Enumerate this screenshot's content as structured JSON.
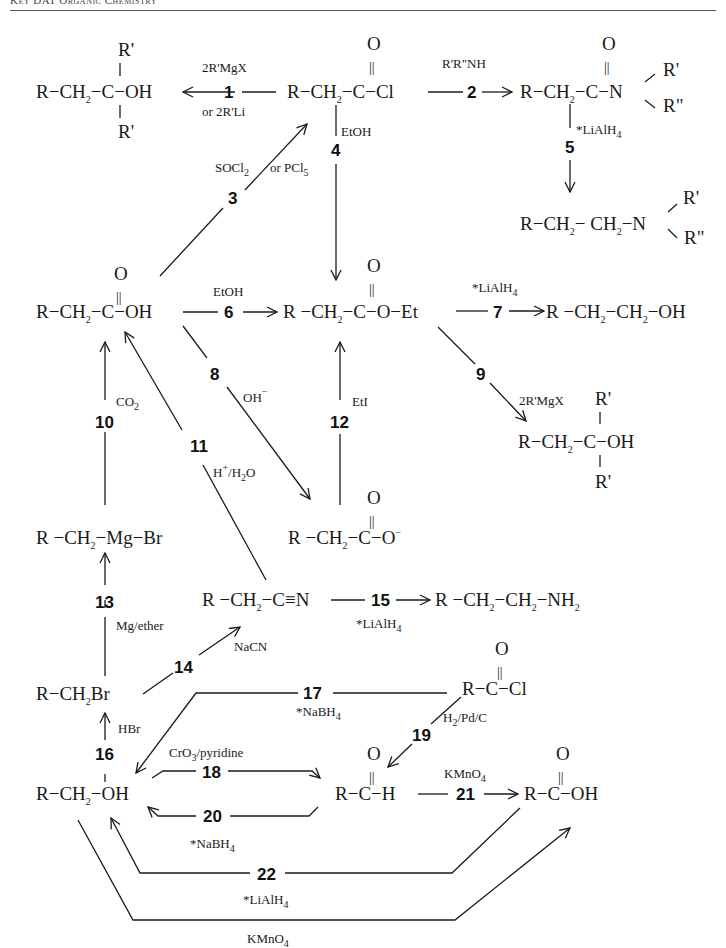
{
  "header": {
    "title": "Key DAT Organic Chemistry"
  },
  "diagram": {
    "compounds": {
      "tert_alcohol_top": {
        "main": "R−CH",
        "sub": "2",
        "rest": "−C−OH",
        "r_top": "R'",
        "r_bottom": "R'"
      },
      "acid_chloride": {
        "o": "O",
        "main": "R−CH",
        "sub": "2",
        "rest": "−C−Cl"
      },
      "amide": {
        "o": "O",
        "main": "R−CH",
        "sub": "2",
        "rest": "−C−N",
        "r1": "R'",
        "r2": "R\""
      },
      "amine_tertiary": {
        "main": "R−CH",
        "sub1": "2",
        "mid": "− CH",
        "sub2": "2",
        "rest": "−N",
        "r1": "R'",
        "r2": "R\""
      },
      "carboxylic_acid": {
        "o": "O",
        "main": "R−CH",
        "sub": "2",
        "rest": "−C−OH"
      },
      "ester": {
        "o": "O",
        "main": "R −CH",
        "sub": "2",
        "rest": "−C−O−Et"
      },
      "primary_alcohol_right": {
        "main": "R −CH",
        "sub1": "2",
        "mid": "−CH",
        "sub2": "2",
        "rest": "−OH"
      },
      "tert_alcohol_right": {
        "main": "R−CH",
        "sub": "2",
        "rest": "−C−OH",
        "r_top": "R'",
        "r_bottom": "R'"
      },
      "grignard": {
        "main": "R −CH",
        "sub": "2",
        "rest": "−Mg−Br"
      },
      "carboxylate": {
        "o": "O",
        "main": "R −CH",
        "sub": "2",
        "rest": "−C−O",
        "charge": "−"
      },
      "nitrile": {
        "main": "R −CH",
        "sub": "2",
        "rest": "−C≡N"
      },
      "primary_amine": {
        "main": "R −CH",
        "sub1": "2",
        "mid": "−CH",
        "sub2": "2",
        "rest": "−NH",
        "sub3": "2"
      },
      "alkyl_bromide": {
        "main": "R−CH",
        "sub": "2",
        "rest": "Br"
      },
      "acyl_chloride_simple": {
        "o": "O",
        "main": "R−C−Cl"
      },
      "primary_alcohol": {
        "main": "R−CH",
        "sub": "2",
        "rest": "−OH"
      },
      "aldehyde": {
        "o": "O",
        "main": "R−C−H"
      },
      "acid_simple": {
        "o": "O",
        "main": "R−C−OH"
      }
    },
    "reactions": [
      {
        "num": "1",
        "reagent": "2R'MgX",
        "reagent2": "or 2R'Li"
      },
      {
        "num": "2",
        "reagent": "R'R\"NH"
      },
      {
        "num": "3",
        "reagent": "SOCl",
        "reagent_sub": "2",
        "reagent2": "or PCl",
        "reagent2_sub": "5"
      },
      {
        "num": "4",
        "reagent": "EtOH"
      },
      {
        "num": "5",
        "reagent": "*LiAlH",
        "reagent_sub": "4"
      },
      {
        "num": "6",
        "reagent": "EtOH"
      },
      {
        "num": "7",
        "reagent": "*LiAlH",
        "reagent_sub": "4"
      },
      {
        "num": "8",
        "reagent": "OH",
        "reagent_sup": "−"
      },
      {
        "num": "9",
        "reagent": "2R'MgX"
      },
      {
        "num": "10",
        "reagent": "CO",
        "reagent_sub": "2"
      },
      {
        "num": "11",
        "reagent": "H",
        "reagent_sup": "+",
        "reagent_rest": "/H",
        "reagent_sub": "2",
        "reagent_end": "O"
      },
      {
        "num": "12",
        "reagent": "EtI"
      },
      {
        "num": "13",
        "reagent": "Mg/ether"
      },
      {
        "num": "14",
        "reagent": "NaCN"
      },
      {
        "num": "15",
        "reagent": "*LiAlH",
        "reagent_sub": "4"
      },
      {
        "num": "16",
        "reagent": "HBr"
      },
      {
        "num": "17",
        "reagent": "*NaBH",
        "reagent_sub": "4"
      },
      {
        "num": "18",
        "reagent": "CrO",
        "reagent_sub": "3",
        "reagent_rest": "/pyridine"
      },
      {
        "num": "19",
        "reagent": "H",
        "reagent_sub": "2",
        "reagent_rest": "/Pd/C"
      },
      {
        "num": "20",
        "reagent": "*NaBH",
        "reagent_sub": "4"
      },
      {
        "num": "21",
        "reagent": "KMnO",
        "reagent_sub": "4"
      },
      {
        "num": "22",
        "reagent": "*LiAlH",
        "reagent_sub": "4"
      },
      {
        "num": "",
        "reagent": "KMnO",
        "reagent_sub": "4"
      }
    ],
    "double_bond": "||",
    "bond_v": "|"
  }
}
